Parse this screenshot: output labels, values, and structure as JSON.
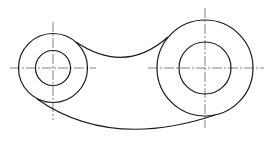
{
  "drawing": {
    "type": "mechanical-link-part",
    "colors": {
      "outline": "#1a1a1a",
      "centerline": "#333333",
      "background": "#ffffff"
    },
    "left_boss": {
      "cx": 53,
      "cy": 68,
      "outer_r": 34.5,
      "inner_r": 17.5
    },
    "right_boss": {
      "cx": 205,
      "cy": 68,
      "outer_r": 48,
      "inner_r": 26
    },
    "top_arc": {
      "from": [
        76,
        42
      ],
      "via": [
        125,
        57
      ],
      "to": [
        168,
        37
      ]
    },
    "bottom_arc": {
      "from": [
        37,
        102
      ],
      "via": [
        130,
        131
      ],
      "to": [
        213,
        116
      ]
    },
    "centerlines": {
      "left_h": [
        10,
        68,
        96,
        68
      ],
      "left_v": [
        53,
        22,
        53,
        120
      ],
      "right_h": [
        148,
        68,
        264,
        68
      ],
      "right_v": [
        205,
        8,
        205,
        128
      ]
    }
  }
}
